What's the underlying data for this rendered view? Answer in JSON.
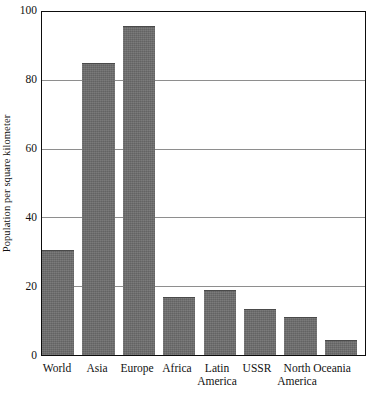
{
  "chart_data": {
    "type": "bar",
    "title": "",
    "xlabel": "",
    "ylabel": "Population per square kilometer",
    "categories": [
      "World",
      "Asia",
      "Europe",
      "Africa",
      "Latin America",
      "USSR",
      "North America",
      "Oceania"
    ],
    "category_lines": [
      [
        "World"
      ],
      [
        "Asia"
      ],
      [
        "Europe"
      ],
      [
        "Africa"
      ],
      [
        "Latin",
        "America"
      ],
      [
        "USSR"
      ],
      [
        "North",
        "America"
      ],
      [
        "Oceania"
      ]
    ],
    "values": [
      30.5,
      85,
      96,
      17,
      19,
      13.5,
      11,
      4.5
    ],
    "ylim": [
      0,
      100
    ],
    "yticks": [
      0,
      20,
      40,
      60,
      80,
      100
    ],
    "ytick_labels": [
      "0",
      "20",
      "40",
      "60",
      "80",
      "100"
    ],
    "gridlines": [
      20,
      40,
      60,
      80
    ],
    "grid": true,
    "legend": null,
    "bar_color": "#6d6d6d",
    "axis_color": "#0d0d0d",
    "grid_color": "#8e8e8e"
  }
}
